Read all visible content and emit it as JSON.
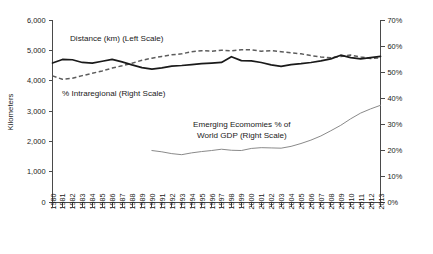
{
  "chart_data": {
    "type": "line",
    "title": "",
    "xlabel": "",
    "ylabel": "Kilometers",
    "y2label": "",
    "grid": false,
    "legend_position": "inline-annotations",
    "x": [
      1980,
      1981,
      1982,
      1983,
      1984,
      1985,
      1986,
      1987,
      1988,
      1989,
      1990,
      1991,
      1992,
      1993,
      1994,
      1995,
      1996,
      1997,
      1998,
      1999,
      2000,
      2001,
      2002,
      2003,
      2004,
      2005,
      2006,
      2007,
      2008,
      2009,
      2010,
      2011,
      2012,
      2013
    ],
    "xtick_labels": [
      "1980",
      "1981",
      "1982",
      "1983",
      "1984",
      "1985",
      "1986",
      "1987",
      "1988",
      "1989",
      "1990",
      "1991",
      "1992",
      "1993",
      "1994",
      "1995",
      "1996",
      "1997",
      "1998",
      "1999",
      "2000",
      "2001",
      "2002",
      "2003",
      "2004",
      "2005",
      "2006",
      "2007",
      "2008",
      "2009",
      "2010",
      "2011",
      "2012",
      "2013"
    ],
    "ylim": [
      0,
      6000
    ],
    "ytick_values": [
      0,
      1000,
      2000,
      3000,
      4000,
      5000,
      6000
    ],
    "ytick_labels": [
      "0",
      "1,000",
      "2,000",
      "3,000",
      "4,000",
      "5,000",
      "6,000"
    ],
    "y2lim": [
      0,
      70
    ],
    "y2tick_values": [
      0,
      10,
      20,
      30,
      40,
      50,
      60,
      70
    ],
    "y2tick_labels": [
      "0%",
      "10%",
      "20%",
      "30%",
      "40%",
      "50%",
      "60%",
      "70%"
    ],
    "series": [
      {
        "name": "Distance (km) (Left Scale)",
        "axis": "left",
        "style": "solid",
        "color": "#1a1a1a",
        "x": [
          1980,
          1981,
          1982,
          1983,
          1984,
          1985,
          1986,
          1987,
          1988,
          1989,
          1990,
          1991,
          1992,
          1993,
          1994,
          1995,
          1996,
          1997,
          1998,
          1999,
          2000,
          2001,
          2002,
          2003,
          2004,
          2005,
          2006,
          2007,
          2008,
          2009,
          2010,
          2011,
          2012,
          2013
        ],
        "values": [
          4580,
          4700,
          4690,
          4600,
          4580,
          4640,
          4700,
          4620,
          4520,
          4430,
          4380,
          4420,
          4480,
          4500,
          4530,
          4560,
          4580,
          4600,
          4790,
          4660,
          4650,
          4600,
          4520,
          4470,
          4530,
          4560,
          4600,
          4650,
          4720,
          4840,
          4760,
          4720,
          4760,
          4800
        ]
      },
      {
        "name": "% Intraregional (Right Scale)",
        "axis": "right",
        "style": "dashed",
        "color": "#5c5c5c",
        "x": [
          1980,
          1981,
          1982,
          1983,
          1984,
          1985,
          1986,
          1987,
          1988,
          1989,
          1990,
          1991,
          1992,
          1993,
          1994,
          1995,
          1996,
          1997,
          1998,
          1999,
          2000,
          2001,
          2002,
          2003,
          2004,
          2005,
          2006,
          2007,
          2008,
          2009,
          2010,
          2011,
          2012,
          2013
        ],
        "values": [
          48.5,
          47.2,
          47.6,
          48.6,
          49.5,
          50.4,
          51.5,
          52.4,
          53.4,
          54.5,
          55.3,
          56.0,
          56.6,
          57.0,
          57.8,
          58.2,
          58.0,
          58.4,
          58.1,
          58.6,
          58.5,
          58.0,
          58.2,
          57.8,
          57.4,
          57.0,
          56.3,
          55.8,
          55.5,
          56.0,
          56.5,
          55.8,
          55.2,
          55.5
        ]
      },
      {
        "name": "Emerging Ecomomies % of World GDP (Right Scale)",
        "axis": "right",
        "style": "thin-solid",
        "color": "#8a8a8a",
        "x": [
          1990,
          1991,
          1992,
          1993,
          1994,
          1995,
          1996,
          1997,
          1998,
          1999,
          2000,
          2001,
          2002,
          2003,
          2004,
          2005,
          2006,
          2007,
          2008,
          2009,
          2010,
          2011,
          2012,
          2013
        ],
        "values": [
          19.8,
          19.3,
          18.6,
          18.2,
          18.9,
          19.4,
          19.8,
          20.3,
          19.9,
          19.8,
          20.6,
          20.9,
          20.8,
          20.7,
          21.4,
          22.5,
          23.8,
          25.4,
          27.4,
          29.5,
          32.0,
          34.2,
          35.8,
          37.2
        ]
      }
    ],
    "annotations": [
      {
        "name": "distance-label",
        "text": "Distance (km) (Left Scale)",
        "x": 70,
        "y": 41
      },
      {
        "name": "intraregional-label",
        "text": "% Intraregional (Right Scale)",
        "x": 62,
        "y": 96
      },
      {
        "name": "emerging-label-1",
        "text": "Emerging Ecomomies % of",
        "x": 193,
        "y": 127
      },
      {
        "name": "emerging-label-2",
        "text": "World GDP (Right Scale)",
        "x": 197,
        "y": 138
      }
    ]
  }
}
